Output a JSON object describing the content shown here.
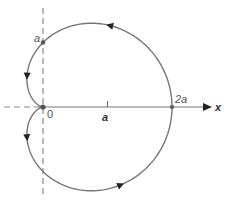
{
  "diagram": {
    "type": "polar-curve",
    "curve_name": "cardioid",
    "equation": "r = a(1 + cos θ)",
    "colors": {
      "curve": "#777777",
      "axis": "#777777",
      "dashed": "#888888",
      "arrow": "#222222",
      "point": "#666666"
    },
    "origin_px": [
      43,
      107
    ],
    "a_px": 64.5,
    "labels": {
      "x_axis": "x",
      "origin": "0",
      "a_on_x": "a",
      "two_a": "2a",
      "a_on_y": "a"
    },
    "direction": "counterclockwise",
    "arrowheads": [
      {
        "position": "lower-right",
        "points": "up-right"
      },
      {
        "position": "upper-right",
        "points": "up-left"
      },
      {
        "position": "upper-left",
        "points": "down"
      },
      {
        "position": "lower-left",
        "points": "up"
      }
    ],
    "marked_points": [
      {
        "name": "origin",
        "x": 0,
        "y": 0
      },
      {
        "name": "y-intercept-top",
        "x": 0,
        "y": "a"
      },
      {
        "name": "x-intercept",
        "x": "2a",
        "y": 0
      }
    ]
  }
}
